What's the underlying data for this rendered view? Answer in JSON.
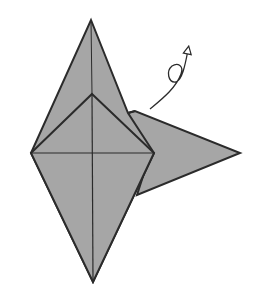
{
  "diagram": {
    "type": "origami-fold-step",
    "fill_color": "#a6a6a6",
    "stroke_color": "#2b2b2b",
    "background": "#ffffff",
    "symbols": [
      {
        "name": "turn-over-arrow",
        "description": "curved arrow with loop indicating turn model over"
      }
    ],
    "shapes": {
      "back_diamond": {
        "top": [
          91,
          20
        ],
        "left": [
          31,
          153
        ],
        "right_notch": [
          128,
          113
        ],
        "bottom": [
          93,
          282
        ]
      },
      "right_flap": {
        "notch_top": [
          135,
          111
        ],
        "tip": [
          240,
          153
        ],
        "notch_bottom": [
          137,
          195
        ]
      },
      "front_kite": {
        "top": [
          92,
          94
        ],
        "left": [
          31,
          153
        ],
        "right": [
          154,
          153
        ],
        "bottom": [
          93,
          282
        ]
      }
    }
  }
}
